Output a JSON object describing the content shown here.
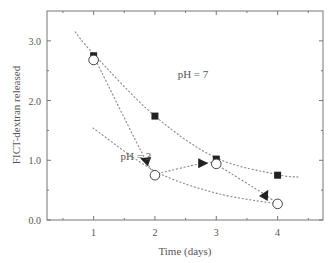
{
  "chart_data": {
    "type": "scatter",
    "title": "",
    "xlabel": "Time (days)",
    "ylabel": "FICT-dextran released",
    "xlim": [
      0.24,
      4.74
    ],
    "ylim": [
      0.0,
      3.5
    ],
    "x_ticks": [
      1,
      2,
      3,
      4
    ],
    "x_tick_labels": [
      "1",
      "2",
      "3",
      "4"
    ],
    "x_minor_ticks": [
      0.5,
      1.5,
      2.5,
      3.5,
      4.5
    ],
    "y_ticks": [
      0.0,
      1.0,
      2.0,
      3.0
    ],
    "y_tick_labels": [
      "0.0",
      "1.0",
      "2.0",
      "3.0"
    ],
    "y_minor_ticks": [
      0.5,
      1.5,
      2.5
    ],
    "grid": false,
    "legend": "none",
    "series": [
      {
        "name": "pH = 7 (filled square)",
        "marker": "square-filled",
        "x": [
          1,
          2,
          3,
          4
        ],
        "y": [
          2.75,
          1.74,
          1.02,
          0.75
        ]
      },
      {
        "name": "open circle",
        "marker": "circle-open",
        "x": [
          1,
          2,
          3,
          4
        ],
        "y": [
          2.68,
          0.75,
          0.94,
          0.27
        ]
      },
      {
        "name": "triangles (direction arrows)",
        "marker": "triangle-filled",
        "points": [
          {
            "x": 1.85,
            "y": 1.0,
            "direction": "down-left"
          },
          {
            "x": 2.77,
            "y": 0.95,
            "direction": "right"
          },
          {
            "x": 3.8,
            "y": 0.42,
            "direction": "down-right"
          }
        ]
      }
    ],
    "dotted_curves": [
      {
        "name": "pH7-trend",
        "points": [
          [
            0.7,
            3.15
          ],
          [
            1,
            2.78
          ],
          [
            2,
            1.74
          ],
          [
            3,
            1.04
          ],
          [
            4,
            0.76
          ],
          [
            4.35,
            0.72
          ]
        ]
      },
      {
        "name": "pH3-trend",
        "points": [
          [
            0.99,
            1.54
          ],
          [
            2,
            0.82
          ],
          [
            3,
            0.45
          ],
          [
            4,
            0.27
          ]
        ]
      },
      {
        "name": "path-1-to-2",
        "points": [
          [
            1.06,
            2.62
          ],
          [
            1.85,
            1.0
          ],
          [
            2,
            0.8
          ]
        ]
      },
      {
        "name": "path-2-to-3",
        "points": [
          [
            2.05,
            0.78
          ],
          [
            2.77,
            0.95
          ],
          [
            2.95,
            0.96
          ]
        ]
      },
      {
        "name": "path-3-to-4",
        "points": [
          [
            3.05,
            0.9
          ],
          [
            3.8,
            0.42
          ],
          [
            3.95,
            0.3
          ]
        ]
      }
    ],
    "annotations": [
      {
        "text": "pH = 7",
        "x": 2.37,
        "y": 2.38
      },
      {
        "text": "pH = 3",
        "x": 1.44,
        "y": 1.0
      }
    ]
  }
}
